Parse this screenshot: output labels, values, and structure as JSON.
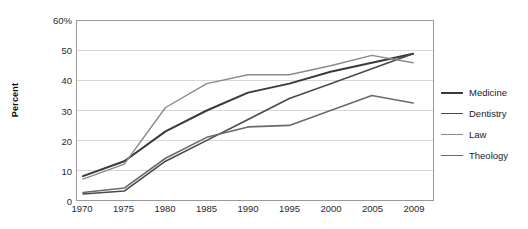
{
  "chart_data": {
    "type": "line",
    "title": "",
    "xlabel": "",
    "ylabel": "Percent",
    "x": [
      1970,
      1975,
      1980,
      1985,
      1990,
      1995,
      2000,
      2005,
      2009
    ],
    "categories": [
      "1970",
      "1975",
      "1980",
      "1985",
      "1990",
      "1995",
      "2000",
      "2005",
      "2009"
    ],
    "xtick_labels": [
      "1970",
      "1975",
      "1980",
      "1985",
      "1990",
      "1995",
      "2000",
      "2005",
      "2009"
    ],
    "ytick_labels": [
      "0",
      "10",
      "20",
      "30",
      "40",
      "50",
      "60%"
    ],
    "yticks": [
      0,
      10,
      20,
      30,
      40,
      50,
      60
    ],
    "ylim": [
      0,
      60
    ],
    "grid": "horizontal",
    "legend_position": "right",
    "series": [
      {
        "name": "Medicine",
        "color": "#3a3a3a",
        "width": 2.0,
        "values": [
          8,
          13,
          23,
          30,
          36,
          39,
          43,
          46,
          49
        ]
      },
      {
        "name": "Dentistry",
        "color": "#4a4a4a",
        "width": 1.6,
        "values": [
          2,
          3,
          13,
          20,
          27,
          34,
          39,
          44,
          49
        ]
      },
      {
        "name": "Law",
        "color": "#8a8a8a",
        "width": 1.4,
        "values": [
          7,
          12,
          31,
          39,
          42,
          42,
          45,
          48.5,
          46
        ]
      },
      {
        "name": "Theology",
        "color": "#6a6a6a",
        "width": 1.6,
        "values": [
          2.5,
          4,
          14,
          21,
          24.5,
          25,
          30,
          35,
          32.5
        ]
      }
    ]
  },
  "legend": {
    "items": [
      {
        "label": "Medicine"
      },
      {
        "label": "Dentistry"
      },
      {
        "label": "Law"
      },
      {
        "label": "Theology"
      }
    ]
  },
  "axes": {
    "y_title": "Percent"
  }
}
